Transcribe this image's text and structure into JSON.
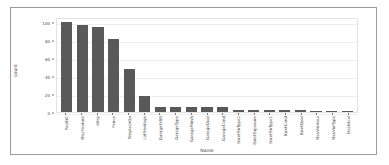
{
  "chart_data": {
    "type": "bar",
    "title": "",
    "xlabel": "Name",
    "ylabel": "count",
    "ylim": [
      0,
      105
    ],
    "yticks": [
      0,
      20,
      40,
      60,
      80,
      100
    ],
    "grid": true,
    "legend": null,
    "bar_color": "#595959",
    "categories": [
      "PoolQC",
      "MiscFeature",
      "Alley",
      "Fence",
      "FireplaceQu",
      "LotFrontage",
      "GarageYrBlt",
      "GarageType",
      "GarageFinish",
      "GarageQual",
      "GarageCond",
      "BsmtFinType2",
      "BsmtExposure",
      "BsmtFinType1",
      "BsmtCond",
      "BsmtQual",
      "MasVnrArea",
      "MasVnrType",
      "Electrical"
    ],
    "values": [
      99.5,
      96.3,
      93.8,
      80.8,
      47.3,
      17.7,
      5.5,
      5.5,
      5.5,
      5.5,
      5.5,
      2.6,
      2.6,
      2.5,
      2.5,
      2.5,
      0.5,
      0.5,
      0.1
    ]
  }
}
